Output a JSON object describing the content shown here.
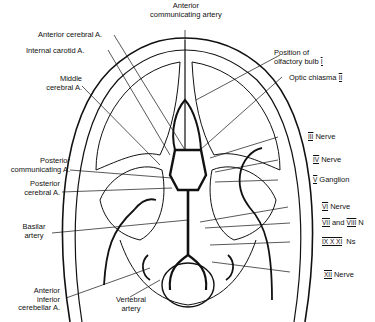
{
  "diagram": {
    "labels": {
      "anterior_communicating": "Anterior communicating artery",
      "anterior_communicating_l1": "Anterior",
      "anterior_communicating_l2": "communicating artery",
      "anterior_cerebral": "Anterior cerebral A.",
      "internal_carotid": "Internal carotid A.",
      "middle_cerebral_l1": "Middle",
      "middle_cerebral_l2": "cerebral A.",
      "olfactory_l1": "Position of",
      "olfactory_l2": "olfactory bulb",
      "olfactory_numeral": "I",
      "optic_chiasma": "Optic chiasma",
      "optic_numeral": "II",
      "nerve3_numeral": "III",
      "nerve3_text": "Nerve",
      "nerve4_numeral": "IV",
      "nerve4_text": "Nerve",
      "ganglion5_numeral": "V",
      "ganglion5_text": "Ganglion",
      "nerve6_numeral": "VI",
      "nerve6_text": "Nerve",
      "nerve78_numeral_a": "VII",
      "nerve78_and": "and",
      "nerve78_numeral_b": "VIII",
      "nerve78_text": "N",
      "nerve91011_numerals": "IX X XI",
      "nerve91011_text": "Ns",
      "nerve12_numeral": "XII",
      "nerve12_text": "Nerve",
      "post_comm_l1": "Posterior",
      "post_comm_l2": "communicating A.",
      "post_cerebral_l1": "Posterior",
      "post_cerebral_l2": "cerebral A.",
      "basilar_l1": "Basilar",
      "basilar_l2": "artery",
      "aica_l1": "Anterior",
      "aica_l2": "inferior",
      "aica_l3": "cerebellar A.",
      "vertebral_l1": "Vertebral",
      "vertebral_l2": "artery"
    }
  }
}
